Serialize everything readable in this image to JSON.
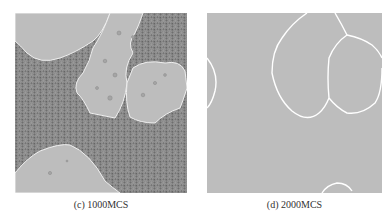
{
  "figure": {
    "panels": [
      {
        "id": "c",
        "caption": "(c) 1000MCS",
        "description": "Monte Carlo grain growth simulation at 1000 MCS: large smooth grains surrounded by fine-grained matrix",
        "colors": {
          "large_grain": "#bdbdbd",
          "fine_matrix": "#7a7a7a",
          "boundary": "#f2f2f2"
        }
      },
      {
        "id": "d",
        "caption": "(d) 2000MCS",
        "description": "Monte Carlo grain growth simulation at 2000 MCS: fully coarsened grains with white boundaries",
        "colors": {
          "grain": "#bdbdbd",
          "boundary": "#ffffff"
        }
      }
    ]
  }
}
